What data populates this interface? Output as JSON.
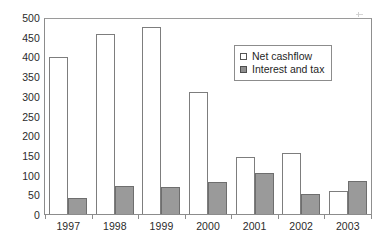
{
  "chart_data": {
    "type": "bar",
    "title": "",
    "subtitle": "",
    "xlabel": "",
    "ylabel": "",
    "categories": [
      "1997",
      "1998",
      "1999",
      "2000",
      "2001",
      "2002",
      "2003"
    ],
    "series": [
      {
        "name": "Net cashflow",
        "values": [
          403,
          462,
          480,
          313,
          146,
          157,
          58
        ],
        "swatch": "hollow-square",
        "color": "#ffffff",
        "border_color": "#7d7d7d"
      },
      {
        "name": "Interest and tax",
        "values": [
          42,
          72,
          68,
          81,
          104,
          51,
          84
        ],
        "swatch": "filled-square",
        "color": "#9a9a9a",
        "border_color": "#6e6e6e"
      }
    ],
    "ylim": [
      0,
      500
    ],
    "ytick_step": 50,
    "yticks": [
      0,
      50,
      100,
      150,
      200,
      250,
      300,
      350,
      400,
      450,
      500
    ],
    "ytick_labels": [
      "0",
      "50",
      "100",
      "150",
      "200",
      "250",
      "300",
      "350",
      "400",
      "450",
      "500"
    ],
    "grid": false,
    "legend_position": "inside-upper-right",
    "frame": true
  },
  "legend": {
    "entries": [
      {
        "label": "Net cashflow"
      },
      {
        "label": "Interest and tax"
      }
    ]
  },
  "artifact": {
    "name": "scan-speck"
  }
}
